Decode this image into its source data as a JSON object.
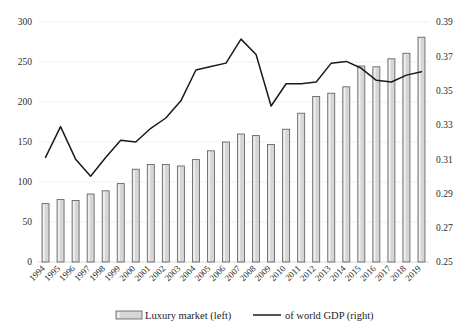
{
  "chart_data": {
    "type": "bar",
    "title": "",
    "subtitle": "",
    "xlabel": "",
    "ylabel": "",
    "grid": true,
    "legend_position": "bottom",
    "categories": [
      "1994",
      "1995",
      "1996",
      "1997",
      "1998",
      "1999",
      "2000",
      "2001",
      "2002",
      "2003",
      "2004",
      "2005",
      "2006",
      "2007",
      "2008",
      "2009",
      "2010",
      "2011",
      "2012",
      "2013",
      "2014",
      "2015",
      "2016",
      "2017",
      "2018",
      "2019"
    ],
    "left_axis": {
      "ylim": [
        0,
        300
      ],
      "ticks": [
        0,
        50,
        100,
        150,
        200,
        250,
        300
      ],
      "tick_labels": [
        "0",
        "50",
        "100",
        "150",
        "200",
        "250",
        "300"
      ]
    },
    "right_axis": {
      "ylim": [
        0.25,
        0.39
      ],
      "ticks": [
        0.25,
        0.27,
        0.29,
        0.31,
        0.33,
        0.35,
        0.37,
        0.39
      ],
      "tick_labels": [
        "0.25",
        "0.27",
        "0.29",
        "0.31",
        "0.33",
        "0.35",
        "0.37",
        "0.39"
      ]
    },
    "series": [
      {
        "name": "Luxury market (left)",
        "type": "bar",
        "axis": "left",
        "color": "#d6d6d6",
        "values": [
          73,
          78,
          77,
          85,
          89,
          98,
          116,
          122,
          122,
          120,
          128,
          139,
          150,
          160,
          158,
          147,
          166,
          186,
          207,
          211,
          219,
          245,
          244,
          254,
          261,
          281
        ]
      },
      {
        "name": "of world GDP (right)",
        "type": "line",
        "axis": "right",
        "color": "#1a1a1a",
        "values": [
          0.311,
          0.329,
          0.31,
          0.3,
          0.311,
          0.321,
          0.32,
          0.328,
          0.334,
          0.344,
          0.362,
          0.364,
          0.366,
          0.38,
          0.371,
          0.341,
          0.354,
          0.354,
          0.355,
          0.366,
          0.367,
          0.363,
          0.356,
          0.355,
          0.359,
          0.361
        ]
      }
    ]
  },
  "legend": {
    "items": [
      {
        "label": "Luxury market (left)",
        "marker": "bar-swatch"
      },
      {
        "label": "of world GDP (right)",
        "marker": "line-swatch"
      }
    ]
  },
  "colors": {
    "bar_fill": "#d6d6d6",
    "bar_stroke": "#5a5a5a",
    "line_stroke": "#1a1a1a",
    "gridline": "#efefef",
    "text": "#232323",
    "background": "#ffffff"
  }
}
